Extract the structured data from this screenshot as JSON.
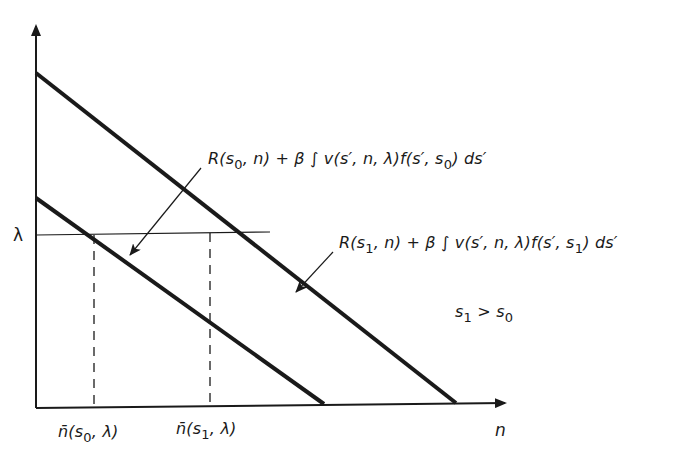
{
  "diagram": {
    "axes": {
      "x_label": "n",
      "y_label": "λ"
    },
    "curves": [
      {
        "id": "s0",
        "label_parts": {
          "R": "R(s",
          "sub1": "0",
          "mid": ", n) + β ∫ v(s′, n, λ)f(s′, s",
          "sub2": "0",
          "end": ") ds′"
        },
        "label_text": "R(s0, n) + β ∫ v(s′, n, λ)f(s′, s0) ds′"
      },
      {
        "id": "s1",
        "label_parts": {
          "R": "R(s",
          "sub1": "1",
          "mid": ", n) + β ∫ v(s′, n, λ)f(s′, s",
          "sub2": "1",
          "end": ") ds′"
        },
        "label_text": "R(s1, n) + β ∫ v(s′, n, λ)f(s′, s1) ds′"
      }
    ],
    "x_ticks": [
      {
        "prefix": "n̄(s",
        "sub": "0",
        "suffix": ", λ)"
      },
      {
        "prefix": "n̄(s",
        "sub": "1",
        "suffix": ", λ)"
      }
    ],
    "condition": {
      "a": "s",
      "a_sub": "1",
      "op": " > ",
      "b": "s",
      "b_sub": "0"
    },
    "lambda_level": "λ",
    "colors": {
      "ink": "#1a1a1a",
      "background": "#ffffff"
    }
  }
}
